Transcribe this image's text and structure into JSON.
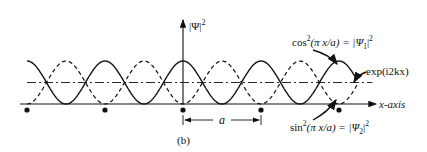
{
  "figure": {
    "panel_label": "(b)",
    "y_axis_label": "|Ψ|",
    "y_axis_label_exp": "2",
    "x_axis_label": "x-axis",
    "period_label": "a",
    "annotations": {
      "cos": {
        "pre": "cos",
        "sup": "2",
        "mid": "(π x/a) = |Ψ",
        "sub": "1",
        "post": "|",
        "sup2": "2"
      },
      "sin": {
        "pre": "sin",
        "sup": "2",
        "mid": "(π x/a) = |Ψ",
        "sub": "2",
        "post": "|",
        "sup2": "2"
      },
      "exp": {
        "text": "exp(i2kx)"
      }
    },
    "colors": {
      "ink": "#111111",
      "background": "#ffffff"
    }
  },
  "chart_data": {
    "type": "line",
    "title": "",
    "xlabel": "x-axis",
    "ylabel": "|Ψ|²",
    "x_range_periods": [
      -2.0,
      2.25
    ],
    "ion_positions_periods": [
      -2,
      -1,
      0,
      1,
      2
    ],
    "series": [
      {
        "name": "cos²(πx/a) = |Ψ1|²",
        "style": "solid",
        "function": "cos^2(pi x / a)"
      },
      {
        "name": "sin²(πx/a) = |Ψ2|²",
        "style": "dashed",
        "function": "sin^2(pi x / a)"
      },
      {
        "name": "exp(i2kx)",
        "style": "dash-dot",
        "function": "constant 0.5 (traveling wave average)"
      }
    ],
    "ylim": [
      0,
      1
    ]
  }
}
